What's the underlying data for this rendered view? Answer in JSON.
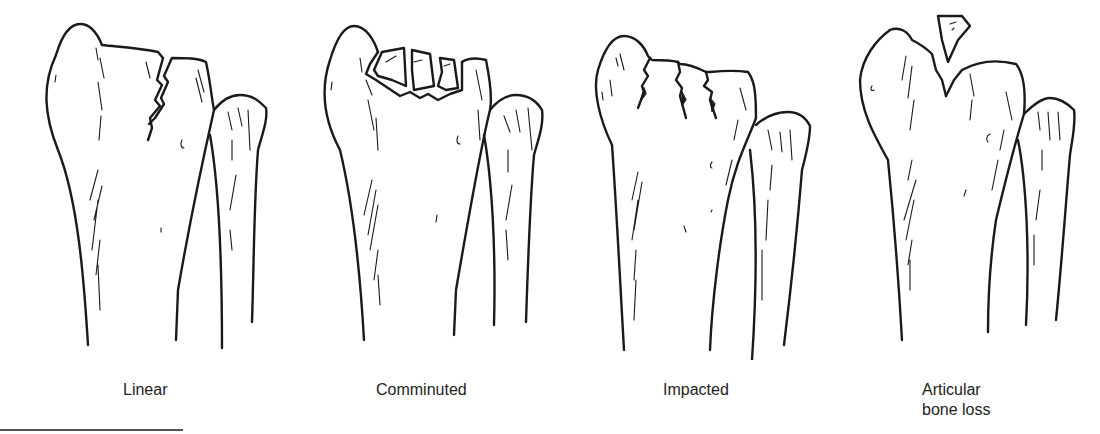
{
  "figure": {
    "panels": [
      {
        "id": "linear",
        "label": "Linear"
      },
      {
        "id": "comminuted",
        "label": "Comminuted"
      },
      {
        "id": "impacted",
        "label": "Impacted"
      },
      {
        "id": "articular-bone-loss",
        "label_line1": "Articular",
        "label_line2": "bone loss"
      }
    ]
  }
}
